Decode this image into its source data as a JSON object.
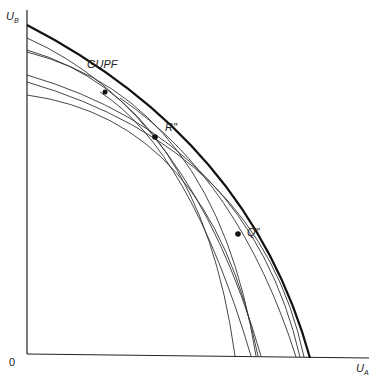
{
  "diagram": {
    "axes": {
      "origin_label": "0",
      "y_label": "U",
      "y_sub": "B",
      "x_label": "U",
      "x_sub": "A"
    },
    "labels": {
      "gupf": "GUPF",
      "r": "R\"",
      "q": "Q\""
    },
    "colors": {
      "line": "#2a2a2a",
      "frontier": "#111111"
    }
  }
}
